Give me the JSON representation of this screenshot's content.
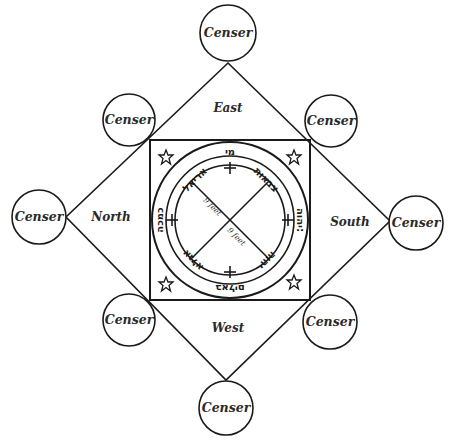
{
  "diagram": {
    "colors": {
      "stroke": "#1a1a1a",
      "text": "#2a2a2a",
      "background": "#ffffff"
    },
    "censers": [
      {
        "id": "top",
        "label": "Censer"
      },
      {
        "id": "top-left",
        "label": "Censer"
      },
      {
        "id": "top-right",
        "label": "Censer"
      },
      {
        "id": "left",
        "label": "Censer"
      },
      {
        "id": "right",
        "label": "Censer"
      },
      {
        "id": "bottom-left",
        "label": "Censer"
      },
      {
        "id": "bottom-right",
        "label": "Censer"
      },
      {
        "id": "bottom",
        "label": "Censer"
      }
    ],
    "directions": {
      "east": "East",
      "north": "North",
      "south": "South",
      "west": "West"
    },
    "circle": {
      "measure_1": "9 feet",
      "measure_2": "9 feet",
      "outer_ring_text": {
        "top": "מי",
        "left": "כמכה",
        "right": "יהוה:",
        "bottom": "באלים"
      },
      "inner_ring_text": {
        "upper_left": "אריאל",
        "upper_right": "צבאות",
        "lower_left": "אגלא",
        "lower_right": "יהוה"
      },
      "symbols": {
        "cross": "+",
        "pentagram": "pentagram"
      }
    }
  }
}
